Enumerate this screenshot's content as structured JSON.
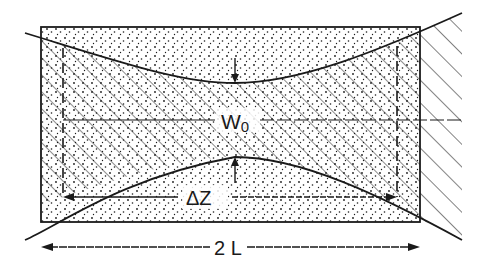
{
  "diagram": {
    "labels": {
      "waist": "W",
      "waist_sub": "0",
      "delta_z": "ΔZ",
      "two_l": "2 L"
    },
    "colors": {
      "ink": "#1a1a1a",
      "background": "#ffffff"
    }
  }
}
